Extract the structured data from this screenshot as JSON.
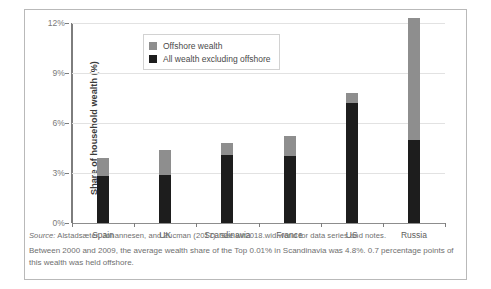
{
  "chart_data": {
    "type": "bar",
    "stacked": true,
    "title": "",
    "xlabel": "",
    "ylabel": "Share of household wealth (%)",
    "ylim": [
      0,
      12
    ],
    "yticks": [
      "0%",
      "3%",
      "6%",
      "9%",
      "12%"
    ],
    "ytick_values": [
      0,
      3,
      6,
      9,
      12
    ],
    "grid": true,
    "legend_position": "upper-left-inside",
    "categories": [
      "Spain",
      "UK",
      "Scandinavia",
      "France",
      "US",
      "Russia"
    ],
    "series": [
      {
        "name": "All wealth excluding offshore",
        "color": "#1d1d1d",
        "values": [
          2.85,
          2.9,
          4.1,
          4.0,
          7.2,
          5.0
        ]
      },
      {
        "name": "Offshore wealth",
        "color": "#8e8e8e",
        "values": [
          1.05,
          1.5,
          0.7,
          1.2,
          0.6,
          7.3
        ]
      }
    ],
    "totals": [
      3.9,
      4.4,
      4.8,
      5.2,
      7.8,
      12.3
    ]
  },
  "legend": {
    "items": [
      {
        "label": "Offshore wealth",
        "color": "#8e8e8e"
      },
      {
        "label": "All wealth excluding offshore",
        "color": "#1d1d1d"
      }
    ]
  },
  "footnotes": {
    "source_prefix": "Source:",
    "source_text": " Alstadsæter, Johannesen, and Zucman (2017). See wir2018.wid.world for data series and notes.",
    "note": "Between 2000 and 2009, the average wealth share of the Top 0.01% in Scandinavia was 4.8%. 0.7 percentage points of this wealth was held offshore."
  }
}
